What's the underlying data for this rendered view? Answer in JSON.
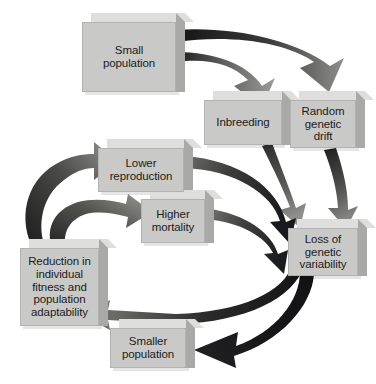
{
  "diagram": {
    "type": "cyclic-flow-diagram",
    "background_color": "#ffffff",
    "box_fill_color": "#c9cac7",
    "box_top_color": "#dedfdc",
    "box_side_color": "#a9aaa7",
    "arrow_dark_color": "#1b1b1b",
    "arrow_light_color": "#8d8e8b",
    "text_color": "#1b1b1b"
  },
  "nodes": [
    {
      "id": "small-population",
      "label": "Small\npopulation",
      "line1": "Small",
      "line2": "population",
      "x": 82,
      "y": 22,
      "w": 94,
      "h": 70,
      "font": 11.5
    },
    {
      "id": "inbreeding",
      "label": "Inbreeding",
      "line1": "Inbreeding",
      "line2": "",
      "x": 204,
      "y": 100,
      "w": 78,
      "h": 45,
      "font": 11.5
    },
    {
      "id": "random-genetic-drift",
      "label": "Random\ngenetic\ndrift",
      "line1": "Random",
      "line2": "genetic",
      "line3": "drift",
      "x": 290,
      "y": 100,
      "w": 66,
      "h": 48,
      "font": 11.5
    },
    {
      "id": "loss-of-genetic-variability",
      "label": "Loss of\ngenetic\nvariability",
      "line1": "Loss of",
      "line2": "genetic",
      "line3": "variability",
      "x": 288,
      "y": 228,
      "w": 70,
      "h": 48,
      "font": 11.5
    },
    {
      "id": "lower-reproduction",
      "label": "Lower\nreproduction",
      "line1": "Lower",
      "line2": "reproduction",
      "x": 98,
      "y": 148,
      "w": 86,
      "h": 44,
      "font": 11.5
    },
    {
      "id": "higher-mortality",
      "label": "Higher\nmortality",
      "line1": "Higher",
      "line2": "mortality",
      "x": 141,
      "y": 199,
      "w": 64,
      "h": 44,
      "font": 11.5
    },
    {
      "id": "reduction-in-individual-fitness",
      "label": "Reduction in\nindividual\nfitness and\npopulation\nadaptability",
      "line1": "Reduction in",
      "line2": "individual",
      "line3": "fitness and",
      "line4": "population",
      "line5": "adaptability",
      "x": 20,
      "y": 248,
      "w": 79,
      "h": 78,
      "font": 11.5
    },
    {
      "id": "smaller-population",
      "label": "Smaller\npopulation",
      "line1": "Smaller",
      "line2": "population",
      "x": 110,
      "y": 328,
      "w": 76,
      "h": 40,
      "font": 11.5
    }
  ],
  "edges": [
    {
      "id": "edge-small-to-inbreeding",
      "from": "small-population",
      "to": "inbreeding",
      "shade": "light"
    },
    {
      "id": "edge-small-to-drift",
      "from": "small-population",
      "to": "random-genetic-drift",
      "shade": "dark"
    },
    {
      "id": "edge-inbreeding-to-loss",
      "from": "inbreeding",
      "to": "loss-of-genetic-variability",
      "shade": "dark"
    },
    {
      "id": "edge-drift-to-loss",
      "from": "random-genetic-drift",
      "to": "loss-of-genetic-variability",
      "shade": "dark"
    },
    {
      "id": "edge-loss-to-reduction",
      "from": "loss-of-genetic-variability",
      "to": "reduction-in-individual-fitness",
      "shade": "dark"
    },
    {
      "id": "edge-loss-to-smaller",
      "from": "loss-of-genetic-variability",
      "to": "smaller-population",
      "shade": "dark"
    },
    {
      "id": "edge-reduction-to-lower-reproduction",
      "from": "reduction-in-individual-fitness",
      "to": "lower-reproduction",
      "shade": "dark"
    },
    {
      "id": "edge-reduction-to-higher-mortality",
      "from": "reduction-in-individual-fitness",
      "to": "higher-mortality",
      "shade": "dark"
    },
    {
      "id": "edge-lower-reproduction-to-loss",
      "from": "lower-reproduction",
      "to": "loss-of-genetic-variability",
      "shade": "dark"
    },
    {
      "id": "edge-higher-mortality-to-loss",
      "from": "higher-mortality",
      "to": "loss-of-genetic-variability",
      "shade": "dark"
    }
  ]
}
